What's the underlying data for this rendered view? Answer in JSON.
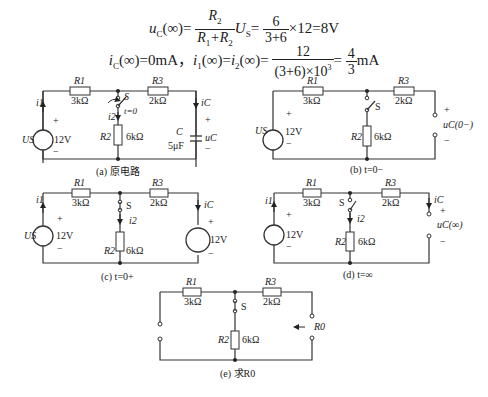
{
  "equations": {
    "eq1": {
      "lhs": "u",
      "lhs_sub": "C",
      "lhs_arg": "(∞)=",
      "frac1_num": "R",
      "frac1_num_sub": "2",
      "frac1_den": "R",
      "frac1_den_sub1": "1",
      "frac1_den_mid": "+R",
      "frac1_den_sub2": "2",
      "mid": "U",
      "mid_sub": "S",
      "mid_eq": "=",
      "frac2_num": "6",
      "frac2_den": "3+6",
      "tail": "×12=8V"
    },
    "eq2": {
      "part1": "i",
      "part1_sub": "C",
      "part1_tail": "(∞)=0mA，",
      "part2": "i",
      "part2_sub": "1",
      "part2_tail": "(∞)=",
      "part3": "i",
      "part3_sub": "2",
      "part3_tail": "(∞)=",
      "frac1_num": "12",
      "frac1_den": "(3+6)×10",
      "frac1_den_sup": "3",
      "eq": "=",
      "frac2_num": "4",
      "frac2_den": "3",
      "unit": "mA"
    }
  },
  "circuits": {
    "a": {
      "caption": "(a) 原电路",
      "R1": "R1",
      "R1_val": "3kΩ",
      "R3": "R3",
      "R3_val": "2kΩ",
      "R2": "R2",
      "R2_val": "6kΩ",
      "switch": "S",
      "switch_time": "t=0",
      "source": "US",
      "source_val": "12V",
      "cap": "C",
      "cap_val": "5μF",
      "cap_voltage": "uC",
      "currents": [
        "i1",
        "i2",
        "iC"
      ],
      "plus": "+",
      "minus": "−"
    },
    "b": {
      "caption": "(b) t=0−",
      "R1": "R1",
      "R1_val": "3kΩ",
      "R3": "R3",
      "R3_val": "2kΩ",
      "R2": "R2",
      "R2_val": "6kΩ",
      "switch": "S",
      "source": "US",
      "source_val": "12V",
      "output_label": "uC(0−)",
      "plus": "+",
      "minus": "−"
    },
    "c": {
      "caption": "(c) t=0+",
      "R1": "R1",
      "R1_val": "3kΩ",
      "R3": "R3",
      "R3_val": "2kΩ",
      "R2": "R2",
      "R2_val": "6kΩ",
      "switch": "S",
      "source": "US",
      "source_val": "12V",
      "source2_val": "12V",
      "currents": [
        "i1",
        "i2",
        "iC"
      ],
      "plus": "+",
      "minus": "−"
    },
    "d": {
      "caption": "(d) t=∞",
      "R1": "R1",
      "R1_val": "3kΩ",
      "R3": "R3",
      "R3_val": "2kΩ",
      "R2": "R2",
      "R2_val": "6kΩ",
      "switch": "S",
      "source_val": "12V",
      "output_label": "uC(∞)",
      "currents": [
        "i1",
        "i2",
        "iC"
      ],
      "plus": "+",
      "minus": "−"
    },
    "e": {
      "caption": "(e) 求R0",
      "R1": "R1",
      "R1_val": "3kΩ",
      "R3": "R3",
      "R3_val": "2kΩ",
      "R2": "R2",
      "R2_val": "6kΩ",
      "switch": "S",
      "output_label": "R0"
    }
  }
}
